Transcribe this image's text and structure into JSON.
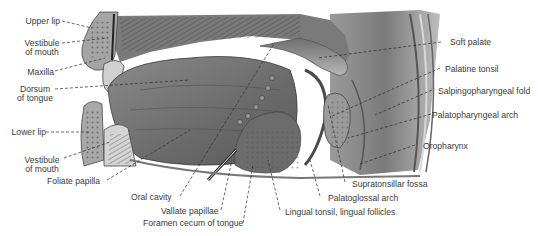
{
  "figure": {
    "labels_left": [
      {
        "id": "upper-lip",
        "text": "Upper lip"
      },
      {
        "id": "vestibule-upper-1",
        "text": "Vestibule"
      },
      {
        "id": "vestibule-upper-2",
        "text": "of mouth"
      },
      {
        "id": "maxilla",
        "text": "Maxilla"
      },
      {
        "id": "dorsum-1",
        "text": "Dorsum"
      },
      {
        "id": "dorsum-2",
        "text": "of tongue"
      },
      {
        "id": "lower-lip",
        "text": "Lower lip"
      },
      {
        "id": "vestibule-lower-1",
        "text": "Vestibule"
      },
      {
        "id": "vestibule-lower-2",
        "text": "of mouth"
      },
      {
        "id": "foliate-papilla",
        "text": "Foliate papilla"
      }
    ],
    "labels_bottom": [
      {
        "id": "oral-cavity",
        "text": "Oral cavity"
      },
      {
        "id": "vallate-papillae",
        "text": "Vallate papillae"
      },
      {
        "id": "foramen-cecum",
        "text": "Foramen cecum of tongue"
      },
      {
        "id": "lingual-tonsil",
        "text": "Lingual tonsil, lingual follicles"
      },
      {
        "id": "palatoglossal-arch",
        "text": "Palatoglossal arch"
      },
      {
        "id": "supratonsillar-fossa",
        "text": "Supratonsillar fossa"
      }
    ],
    "labels_right": [
      {
        "id": "soft-palate",
        "text": "Soft palate"
      },
      {
        "id": "palatine-tonsil",
        "text": "Palatine tonsil"
      },
      {
        "id": "salpingopharyngeal-fold",
        "text": "Salpingopharyngeal fold"
      },
      {
        "id": "palatopharyngeal-arch",
        "text": "Palatopharyngeal arch"
      },
      {
        "id": "oropharynx",
        "text": "Oropharynx"
      }
    ]
  },
  "colors": {
    "label_text": "#3a3a3a",
    "leader_line": "#2a2a2a",
    "tissue_dark": "#5e5e5e",
    "tissue_mid": "#8a8a8a",
    "tissue_light": "#c4c4c4",
    "background": "#ffffff"
  }
}
